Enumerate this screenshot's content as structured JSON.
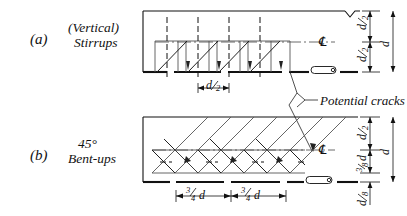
{
  "figure": {
    "background_color": "#ffffff",
    "ink_color": "#111111",
    "light_ink_color": "#555555"
  },
  "panels": [
    {
      "tag": "(a)",
      "name_line1": "(Vertical)",
      "name_line2": "Stirrups",
      "reinforcement_type": "vertical-stirrups",
      "spacing_label": "d/2",
      "spacing_count": 1,
      "centerline_symbol": "℄",
      "dimensions_right": [
        {
          "label": "d/2",
          "num": "d",
          "den": "2"
        },
        {
          "label": "d/2",
          "num": "d",
          "den": "2"
        },
        {
          "label": "d",
          "num": "d",
          "den": ""
        }
      ]
    },
    {
      "tag": "(b)",
      "name_line1": "45°",
      "name_line2": "Bent-ups",
      "reinforcement_type": "45-degree-bent-ups",
      "spacing_label": "3/4 d",
      "spacing_count": 2,
      "centerline_symbol": "℄",
      "dimensions_right": [
        {
          "label": "d/2",
          "num": "d",
          "den": "2"
        },
        {
          "label": "3/8 d",
          "num": "3",
          "den": "8"
        },
        {
          "label": "d",
          "num": "d",
          "den": ""
        },
        {
          "label": "d/8",
          "num": "d",
          "den": "8"
        }
      ]
    }
  ],
  "annotations": {
    "potential_cracks": "Potential cracks"
  },
  "dimension_texts": {
    "d_over_2": {
      "num": "d",
      "den": "2"
    },
    "three_quarter_d": {
      "num": "3",
      "den": "4",
      "suffix": "d"
    },
    "three_eighth_d": {
      "num": "3",
      "den": "8",
      "suffix": "d"
    },
    "d_over_8": {
      "num": "d",
      "den": "8"
    },
    "d": "d"
  }
}
